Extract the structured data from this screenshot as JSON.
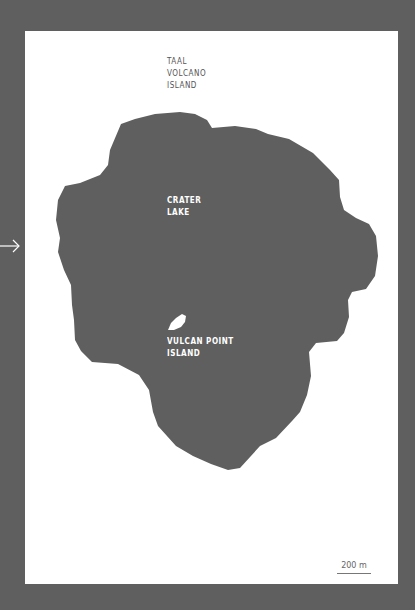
{
  "map": {
    "colors": {
      "background": "#5f5f5f",
      "panel": "#ffffff",
      "water": "#5f5f5f",
      "island": "#ffffff",
      "label_dark": "#555555",
      "label_light": "#ffffff"
    },
    "labels": {
      "taal_volcano_island": [
        "TAAL",
        "VOLCANO",
        "ISLAND"
      ],
      "crater_lake": [
        "CRATER",
        "LAKE"
      ],
      "vulcan_point_island": [
        "VULCAN POINT",
        "ISLAND"
      ]
    },
    "scale_bar": {
      "label": "200 m"
    },
    "arrow_icon": "arrow-right-icon"
  }
}
